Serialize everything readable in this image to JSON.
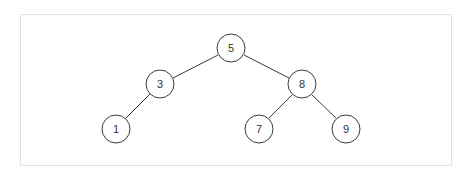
{
  "diagram": {
    "type": "binary-search-tree",
    "frame": {
      "border_color": "#e2e2e2"
    },
    "style": {
      "stroke_color": "#3a3a3a",
      "label_color": "#333333",
      "node_radius": 14
    },
    "nodes": [
      {
        "id": "n5",
        "label": "5",
        "x": 231,
        "y": 48
      },
      {
        "id": "n3",
        "label": "3",
        "x": 160,
        "y": 84
      },
      {
        "id": "n8",
        "label": "8",
        "x": 302,
        "y": 84
      },
      {
        "id": "n1",
        "label": "1",
        "x": 116,
        "y": 129
      },
      {
        "id": "n7",
        "label": "7",
        "x": 259,
        "y": 129
      },
      {
        "id": "n9",
        "label": "9",
        "x": 346,
        "y": 129
      }
    ],
    "edges": [
      {
        "from": "n5",
        "to": "n3"
      },
      {
        "from": "n5",
        "to": "n8"
      },
      {
        "from": "n3",
        "to": "n1"
      },
      {
        "from": "n8",
        "to": "n7"
      },
      {
        "from": "n8",
        "to": "n9"
      }
    ]
  }
}
